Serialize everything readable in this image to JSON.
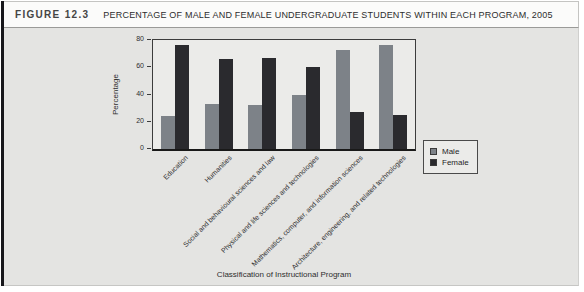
{
  "figure": {
    "label": "FIGURE 12.3",
    "title": "PERCENTAGE OF MALE AND FEMALE UNDERGRADUATE STUDENTS WITHIN EACH PROGRAM, 2005"
  },
  "colors": {
    "male_bar": "#7d8288",
    "female_bar": "#2a2a2e",
    "panel_background": "#e4e4e2",
    "plot_background": "#ebebe9",
    "frame": "#3c3c3c"
  },
  "chart_data": {
    "type": "bar",
    "title": "PERCENTAGE OF MALE AND FEMALE UNDERGRADUATE STUDENTS WITHIN EACH PROGRAM, 2005",
    "categories": [
      "Education",
      "Humanities",
      "Social and behavioural sciences and law",
      "Physical and life sciences and technologies",
      "Mathematics, computer, and information sciences",
      "Architecture, engineering, and related technologies"
    ],
    "series": [
      {
        "name": "Male",
        "color": "#7d8288",
        "values": [
          24,
          33,
          32,
          40,
          73,
          76
        ]
      },
      {
        "name": "Female",
        "color": "#2a2a2e",
        "values": [
          76,
          66,
          67,
          60,
          27,
          25
        ]
      }
    ],
    "xlabel": "Classification of Instructional Program",
    "ylabel": "Percentage",
    "yticks": [
      0,
      20,
      40,
      60,
      80
    ],
    "ylim": [
      0,
      80
    ],
    "grid": false,
    "legend_position": "right-of-plot-below"
  }
}
